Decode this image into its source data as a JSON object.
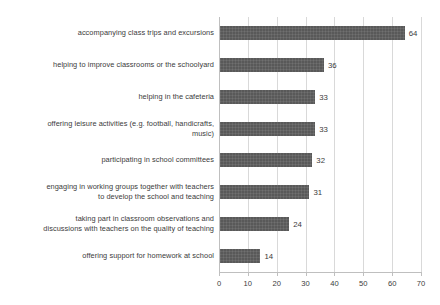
{
  "chart_data": {
    "type": "bar",
    "orientation": "horizontal",
    "title": "",
    "subtitle": "",
    "xlabel": "",
    "ylabel": "",
    "xlim": [
      0,
      70
    ],
    "xticks": [
      "0",
      "10",
      "20",
      "30",
      "40",
      "50",
      "60",
      "70"
    ],
    "grid": "vertical",
    "legend": "none",
    "bar_color": "#595959",
    "gridline_color": "#d9d9d9",
    "text_color": "#3b3b3b",
    "background_color": "#ffffff",
    "categories": [
      "accompanying class trips and excursions",
      "helping to improve classrooms or the schoolyard",
      "helping in the cafeteria",
      "offering leisure activities (e.g. football, handicrafts,\nmusic)",
      "participating in school committees",
      "engaging in working groups together with teachers\nto develop the school and teaching",
      "taking part in classroom observations and\ndiscussions with teachers on the quality of teaching",
      "offering support for homework at school"
    ],
    "values": [
      64,
      36,
      33,
      33,
      32,
      31,
      24,
      14
    ],
    "value_labels": [
      "64",
      "36",
      "33",
      "33",
      "32",
      "31",
      "24",
      "14"
    ]
  }
}
